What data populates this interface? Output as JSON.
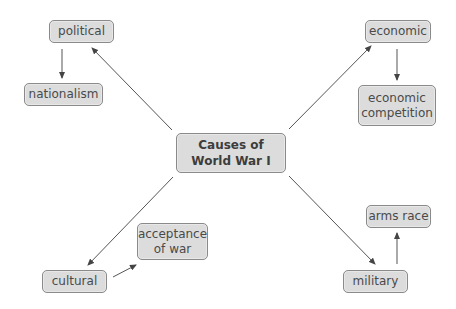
{
  "diagram": {
    "type": "concept-map",
    "colors": {
      "node_fill": "#dcdcdc",
      "node_border": "#8a8a8a",
      "text": "#4a4a4a",
      "arrow": "#555555",
      "background": "#ffffff"
    },
    "nodes": {
      "center": {
        "label": "Causes of\nWorld War I"
      },
      "political": {
        "label": "political"
      },
      "nationalism": {
        "label": "nationalism"
      },
      "economic": {
        "label": "economic"
      },
      "economic_competition": {
        "label": "economic\ncompetition"
      },
      "cultural": {
        "label": "cultural"
      },
      "acceptance_of_war": {
        "label": "acceptance\nof war"
      },
      "military": {
        "label": "military"
      },
      "arms_race": {
        "label": "arms race"
      }
    },
    "edges": [
      {
        "from": "center",
        "to": "political"
      },
      {
        "from": "political",
        "to": "nationalism"
      },
      {
        "from": "center",
        "to": "economic"
      },
      {
        "from": "economic",
        "to": "economic_competition"
      },
      {
        "from": "center",
        "to": "cultural"
      },
      {
        "from": "cultural",
        "to": "acceptance_of_war"
      },
      {
        "from": "center",
        "to": "military"
      },
      {
        "from": "military",
        "to": "arms_race"
      }
    ]
  }
}
